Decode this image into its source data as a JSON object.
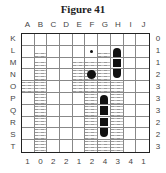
{
  "title": "Figure 41",
  "columns": [
    "A",
    "B",
    "C",
    "D",
    "E",
    "F",
    "G",
    "H",
    "I",
    "J"
  ],
  "rows": [
    "K",
    "L",
    "M",
    "N",
    "O",
    "P",
    "Q",
    "R",
    "S",
    "T"
  ],
  "row_counts": [
    "0",
    "1",
    "1",
    "2",
    "3",
    "3",
    "3",
    "2",
    "2",
    "3"
  ],
  "column_counts": [
    "1",
    "0",
    "2",
    "2",
    "1",
    "2",
    "4",
    "3",
    "4",
    "1"
  ],
  "grid": [
    [
      "wave",
      "wave",
      "wave",
      "wave",
      "wave",
      "wave",
      "wave",
      "wave",
      "wave",
      "wave"
    ],
    [
      "empty",
      "wave",
      "empty",
      "empty",
      "empty",
      "dot",
      "wave",
      "ship-top",
      "empty",
      "empty"
    ],
    [
      "empty",
      "wave",
      "empty",
      "empty",
      "wave",
      "wave",
      "wave",
      "ship-mid",
      "empty",
      "empty"
    ],
    [
      "empty",
      "wave",
      "empty",
      "empty",
      "wave",
      "wave-circle",
      "wave",
      "ship-bottom",
      "empty",
      "empty"
    ],
    [
      "wave",
      "wave",
      "empty",
      "empty",
      "wave",
      "wave",
      "wave",
      "wave",
      "empty",
      "empty"
    ],
    [
      "empty",
      "wave",
      "empty",
      "empty",
      "empty",
      "wave",
      "ship-top",
      "wave",
      "empty",
      "empty"
    ],
    [
      "empty",
      "wave",
      "empty",
      "empty",
      "empty",
      "wave",
      "ship-mid",
      "wave",
      "empty",
      "empty"
    ],
    [
      "empty",
      "wave",
      "empty",
      "empty",
      "empty",
      "wave",
      "ship-mid",
      "wave",
      "empty",
      "empty"
    ],
    [
      "empty",
      "wave",
      "empty",
      "empty",
      "empty",
      "wave",
      "ship-bottom",
      "wave",
      "empty",
      "empty"
    ],
    [
      "empty",
      "wave",
      "empty",
      "empty",
      "empty",
      "wave",
      "wave",
      "wave",
      "empty",
      "empty"
    ]
  ],
  "colors": {
    "ship": "#111111",
    "grid_line": "#888888",
    "border": "#222222"
  }
}
